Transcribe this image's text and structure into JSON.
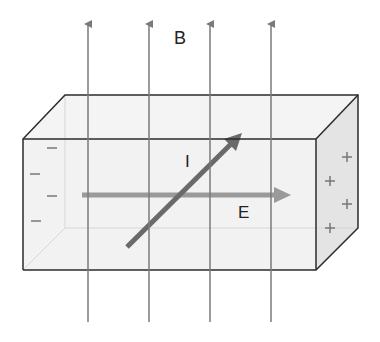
{
  "diagram": {
    "labels": {
      "magnetic_field": "B",
      "current": "I",
      "electric_field": "E"
    },
    "charges": {
      "left_face": [
        "−",
        "−",
        "−",
        "−"
      ],
      "right_face": [
        "+",
        "+",
        "+",
        "+"
      ]
    },
    "field_lines": {
      "count": 4,
      "x_positions": [
        88,
        149,
        210,
        271
      ],
      "direction": "up",
      "color": "#7a7a7a"
    },
    "colors": {
      "box_edge": "#2b2b2b",
      "box_fill": "#f3f3f3",
      "right_face_fill": "#e6e6e6",
      "current_arrow": "#6a6a6a",
      "e_arrow": "#9a9a9a",
      "charge_marks": "#777777"
    }
  }
}
